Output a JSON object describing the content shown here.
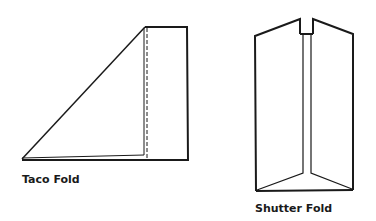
{
  "figures": [
    {
      "id": "taco",
      "label": "Taco Fold",
      "stroke_color": "#1a1a1a"
    },
    {
      "id": "shutter",
      "label": "Shutter Fold",
      "stroke_color": "#1a1a1a"
    }
  ]
}
